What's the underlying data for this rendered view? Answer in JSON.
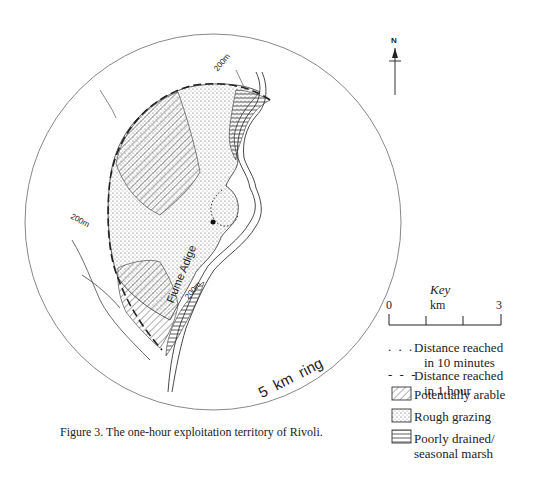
{
  "figure": {
    "caption": "Figure 3. The one-hour exploitation territory of Rivoli.",
    "ring_label": "5  km  ring",
    "north_label": "N",
    "river_label": "Fiume Adige",
    "contour_labels": [
      "200m",
      "200m",
      "200m"
    ],
    "site_name": "Rivoli"
  },
  "key": {
    "title": "Key",
    "scale": {
      "start": "0",
      "unit": "km",
      "end": "3"
    },
    "items": [
      {
        "symbol": "dotted-line",
        "glyph": ". . .",
        "label_line1": "Distance reached",
        "label_line2": "in 10 minutes"
      },
      {
        "symbol": "dashed-line",
        "glyph": "- - -",
        "label_line1": "Distance reached",
        "label_line2": "in 1 hour"
      },
      {
        "symbol": "diagonal-hatch",
        "label_line1": "Potentially arable"
      },
      {
        "symbol": "stipple",
        "label_line1": "Rough grazing"
      },
      {
        "symbol": "horizontal-hatch",
        "label_line1": "Poorly drained/",
        "label_line2": "seasonal marsh"
      }
    ]
  },
  "colors": {
    "ink": "#222222",
    "ring": "#888888",
    "paper": "#ffffff"
  }
}
